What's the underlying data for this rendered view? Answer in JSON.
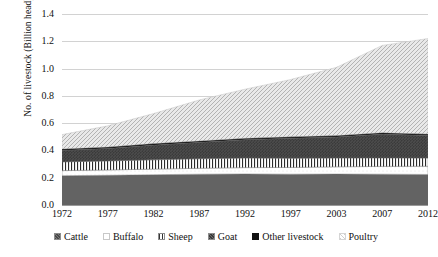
{
  "chart_data": {
    "type": "area",
    "title": "",
    "xlabel": "",
    "ylabel": "No. of livestock (Billion head)",
    "ylim": [
      0.0,
      1.4
    ],
    "ytick_labels": [
      "0.0",
      "0.2",
      "0.4",
      "0.6",
      "0.8",
      "1.0",
      "1.2",
      "1.4"
    ],
    "ytick_values": [
      0.0,
      0.2,
      0.4,
      0.6,
      0.8,
      1.0,
      1.2,
      1.4
    ],
    "grid": true,
    "stacked": true,
    "legend_position": "bottom",
    "categories": [
      "1972",
      "1977",
      "1982",
      "1987",
      "1992",
      "1997",
      "2003",
      "2007",
      "2012"
    ],
    "x": [
      1972,
      1977,
      1982,
      1987,
      1992,
      1997,
      2003,
      2007,
      2012
    ],
    "series": [
      {
        "name": "Cattle",
        "pattern": "solid-dark-gray",
        "color": "#636363",
        "values": [
          0.215,
          0.218,
          0.222,
          0.226,
          0.228,
          0.226,
          0.227,
          0.226,
          0.224
        ]
      },
      {
        "name": "Buffalo",
        "pattern": "white-sparse-dots",
        "color": "#fcfcfc",
        "values": [
          0.037,
          0.039,
          0.041,
          0.043,
          0.046,
          0.049,
          0.053,
          0.057,
          0.06
        ]
      },
      {
        "name": "Sheep",
        "pattern": "vertical-lines",
        "color": "#ffffff",
        "values": [
          0.064,
          0.066,
          0.068,
          0.07,
          0.07,
          0.068,
          0.064,
          0.062,
          0.06
        ]
      },
      {
        "name": "Goat",
        "pattern": "dark-crosshatch",
        "color": "#5e5e5e",
        "values": [
          0.085,
          0.092,
          0.109,
          0.121,
          0.135,
          0.147,
          0.155,
          0.175,
          0.166
        ]
      },
      {
        "name": "Other livestock",
        "pattern": "solid-black-outline",
        "color": "#111111",
        "values": [
          0.01,
          0.01,
          0.01,
          0.01,
          0.01,
          0.01,
          0.01,
          0.01,
          0.01
        ]
      },
      {
        "name": "Poultry",
        "pattern": "light-diagonal-hatch",
        "color": "#d9d9d9",
        "values": [
          0.105,
          0.155,
          0.22,
          0.3,
          0.36,
          0.42,
          0.5,
          0.64,
          0.7
        ]
      }
    ],
    "series_totals": [
      0.516,
      0.58,
      0.67,
      0.77,
      0.849,
      0.92,
      1.009,
      1.17,
      1.22
    ]
  }
}
